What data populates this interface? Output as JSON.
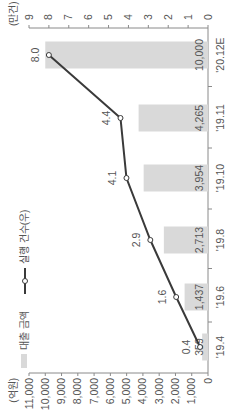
{
  "chart_data": {
    "type": "bar",
    "title": "",
    "categories": [
      "'19.4",
      "'19.6",
      "'19.8",
      "'19.10",
      "'19.11",
      "'20.12E"
    ],
    "series": [
      {
        "name": "대출 금액",
        "type": "bar",
        "axis": "left",
        "values": [
          359,
          1437,
          2713,
          3954,
          4265,
          10000
        ],
        "labels": [
          "359",
          "1,437",
          "2,713",
          "3,954",
          "4,265",
          "10,000"
        ],
        "color": "#d9d9d9"
      },
      {
        "name": "실행 건수(우)",
        "type": "line",
        "axis": "right",
        "values": [
          0.4,
          1.6,
          2.9,
          4.1,
          4.4,
          8.0
        ],
        "labels": [
          "0.4",
          "1.6",
          "2.9",
          "4.1",
          "4.4",
          "8.0"
        ],
        "color": "#3a3a3a"
      }
    ],
    "left_axis": {
      "unit": "(억원)",
      "ylim": [
        0,
        11000
      ],
      "ticks": [
        0,
        1000,
        2000,
        3000,
        4000,
        5000,
        6000,
        7000,
        8000,
        9000,
        10000,
        11000
      ],
      "tick_labels": [
        "0",
        "1,000",
        "2,000",
        "3,000",
        "4,000",
        "5,000",
        "6,000",
        "7,000",
        "8,000",
        "9,000",
        "10,000",
        "11,000"
      ]
    },
    "right_axis": {
      "unit": "(만건)",
      "ylim": [
        0,
        9
      ],
      "ticks": [
        0,
        1,
        2,
        3,
        4,
        5,
        6,
        7,
        8,
        9
      ],
      "tick_labels": [
        "0",
        "1",
        "2",
        "3",
        "4",
        "5",
        "6",
        "7",
        "8",
        "9"
      ]
    },
    "legend": {
      "placement": "top-left",
      "items": [
        "대출 금액",
        "실행 건수(우)"
      ]
    },
    "grid": false,
    "orientation": "rotated-90-ccw"
  }
}
